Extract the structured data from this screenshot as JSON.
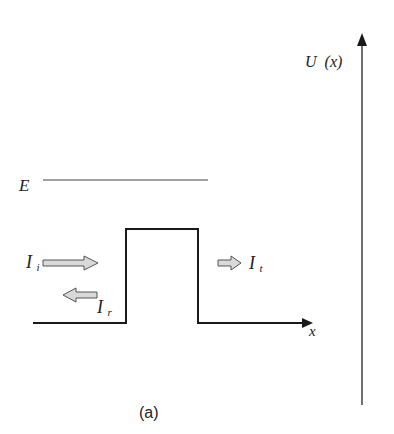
{
  "figure": {
    "caption": "(a)",
    "colors": {
      "line": "#1a1a1a",
      "arrow_fill": "#d9d9d9",
      "arrow_stroke": "#555555"
    }
  },
  "axes": {
    "x_label": "x",
    "y_label_main": "U",
    "y_label_arg": "(x)"
  },
  "energy": {
    "label": "E"
  },
  "barrier": {
    "shape": "rectangular potential barrier"
  },
  "currents": {
    "incident": {
      "symbol": "I",
      "subscript": "i",
      "direction": "right"
    },
    "reflected": {
      "symbol": "I",
      "subscript": "r",
      "direction": "left"
    },
    "transmitted": {
      "symbol": "I",
      "subscript": "t",
      "direction": "right"
    }
  }
}
